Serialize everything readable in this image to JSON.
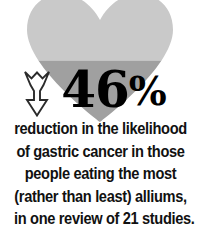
{
  "graphic": {
    "heart_icon": "heart-icon",
    "heart_color_top": "#c9c9c9",
    "heart_color_bottom": "#a0a0a0",
    "heart_fill_split_percent": 52,
    "arrow_icon": "down-arrow-icon",
    "arrow_fill": "#ffffff",
    "arrow_stroke": "#2b2b2b"
  },
  "stat": {
    "number": "46",
    "unit": "%",
    "color": "#000000"
  },
  "caption": {
    "color": "#111111",
    "lines": [
      "reduction in the likelihood",
      "of gastric cancer in those",
      "people eating the most",
      "(rather than least) alliums,",
      "in one review of 21 studies."
    ]
  }
}
